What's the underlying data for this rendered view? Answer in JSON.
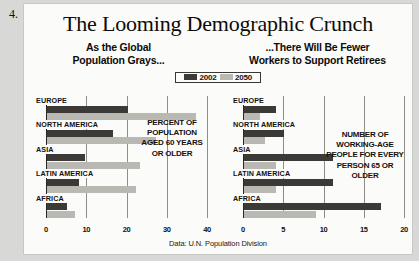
{
  "question_number": "4.",
  "title": "The Looming Demographic Crunch",
  "subheads": {
    "left": "As the Global\nPopulation Grays...",
    "left_line1": "As the Global",
    "left_line2": "Population Grays...",
    "right_line1": "...There Will Be Fewer",
    "right_line2": "Workers to Support Retirees"
  },
  "legend": {
    "items": [
      {
        "label": "2002",
        "color": "#3c3a37"
      },
      {
        "label": "2050",
        "color": "#b9b8b3"
      }
    ]
  },
  "source": "Data: U.N. Population Division",
  "annotations": {
    "left": "PERCENT OF POPULATION AGED 60 YEARS OR OLDER",
    "right": "NUMBER OF WORKING-AGE PEOPLE FOR EVERY PERSON 65 OR OLDER"
  },
  "chart_data": [
    {
      "id": "left",
      "type": "bar",
      "orientation": "horizontal",
      "title": "As the Global Population Grays...",
      "annotation": "PERCENT OF POPULATION AGED 60 YEARS OR OLDER",
      "xlabel": "",
      "ylabel": "",
      "xlim": [
        0,
        40
      ],
      "ticks": [
        0,
        10,
        20,
        30,
        40
      ],
      "grid": true,
      "legend_position": "top-center",
      "categories": [
        "EUROPE",
        "NORTH AMERICA",
        "ASIA",
        "LATIN AMERICA",
        "AFRICA"
      ],
      "series": [
        {
          "name": "2002",
          "color": "#3c3a37",
          "values": [
            20,
            16.5,
            9.5,
            8,
            5
          ]
        },
        {
          "name": "2050",
          "color": "#b9b8b3",
          "values": [
            37,
            27,
            23,
            22,
            7
          ]
        }
      ]
    },
    {
      "id": "right",
      "type": "bar",
      "orientation": "horizontal",
      "title": "...There Will Be Fewer Workers to Support Retirees",
      "annotation": "NUMBER OF WORKING-AGE PEOPLE FOR EVERY PERSON 65 OR OLDER",
      "xlabel": "",
      "ylabel": "",
      "xlim": [
        0,
        20
      ],
      "ticks": [
        0,
        5,
        10,
        15,
        20
      ],
      "grid": true,
      "legend_position": "top-center",
      "categories": [
        "EUROPE",
        "NORTH AMERICA",
        "ASIA",
        "LATIN AMERICA",
        "AFRICA"
      ],
      "series": [
        {
          "name": "2002",
          "color": "#3c3a37",
          "values": [
            4,
            5,
            11,
            11,
            17
          ]
        },
        {
          "name": "2050",
          "color": "#b9b8b3",
          "values": [
            2,
            2.6,
            4,
            4,
            9
          ]
        }
      ]
    }
  ]
}
